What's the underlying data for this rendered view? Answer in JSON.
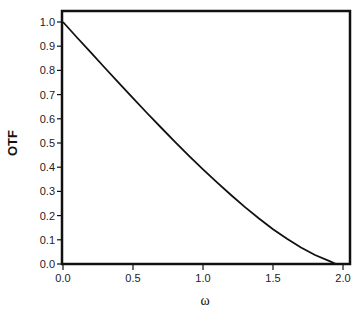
{
  "chart_data": {
    "type": "line",
    "title": "",
    "xlabel": "ω",
    "ylabel": "OTF",
    "xlim": [
      0.0,
      2.0
    ],
    "ylim": [
      0.0,
      1.0
    ],
    "grid": false,
    "legend": null,
    "x_ticks": [
      "0.0",
      "0.5",
      "1.0",
      "1.5",
      "2.0"
    ],
    "y_ticks": [
      "0.0",
      "0.1",
      "0.2",
      "0.3",
      "0.4",
      "0.5",
      "0.6",
      "0.7",
      "0.8",
      "0.9",
      "1.0"
    ],
    "series": [
      {
        "name": "OTF",
        "color": "#111111",
        "x": [
          0.0,
          0.1,
          0.2,
          0.3,
          0.4,
          0.5,
          0.6,
          0.7,
          0.8,
          0.9,
          1.0,
          1.1,
          1.2,
          1.3,
          1.4,
          1.5,
          1.6,
          1.7,
          1.8,
          1.9,
          1.95
        ],
        "y": [
          1.0,
          0.936,
          0.873,
          0.81,
          0.747,
          0.685,
          0.624,
          0.564,
          0.505,
          0.447,
          0.391,
          0.337,
          0.285,
          0.235,
          0.188,
          0.144,
          0.104,
          0.068,
          0.037,
          0.013,
          0.0
        ]
      }
    ]
  }
}
